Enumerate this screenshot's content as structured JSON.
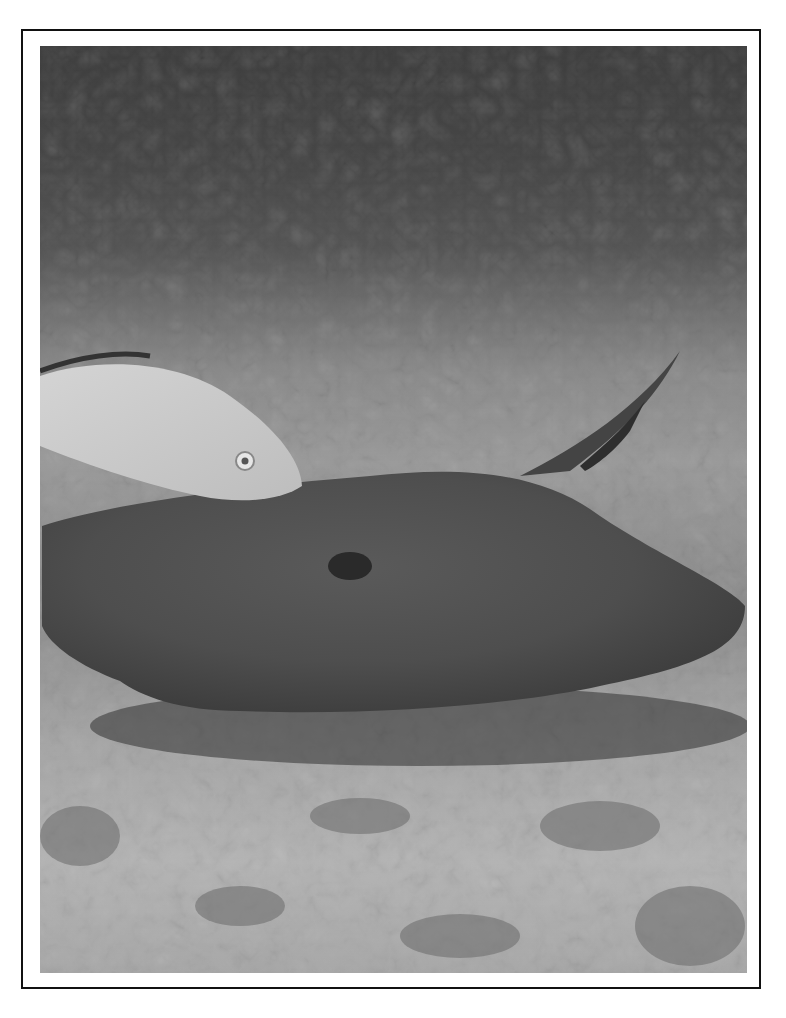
{
  "image": {
    "description": "Grayscale underwater photograph of a stingray resting on a sandy seabed with a silvery fish swimming above it",
    "subjects": [
      "stingray",
      "fish",
      "sandy-seabed",
      "water"
    ],
    "frame": {
      "border_color": "#111111",
      "background": "#ffffff"
    }
  }
}
